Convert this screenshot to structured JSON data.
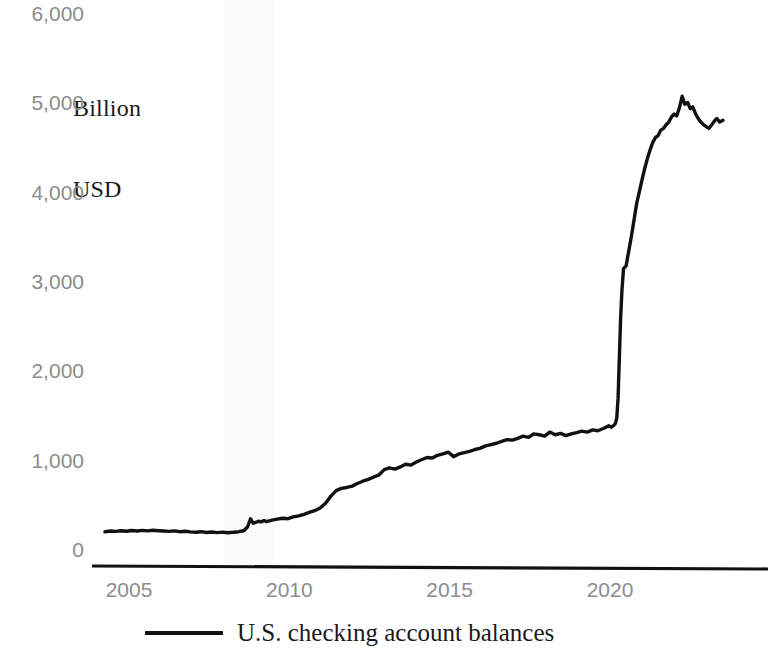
{
  "chart_data": {
    "type": "line",
    "title": "",
    "subtitle": "",
    "unit_label_line1": "Billion",
    "unit_label_line2": "USD",
    "xlabel": "",
    "ylabel": "Billion USD",
    "ylim": [
      0,
      6000
    ],
    "xlim": [
      2004.2,
      2023.6
    ],
    "grid": false,
    "legend_position": "bottom-center",
    "y_ticks": [
      {
        "value": 6000,
        "label": "6,000"
      },
      {
        "value": 5000,
        "label": "5,000"
      },
      {
        "value": 4000,
        "label": "4,000"
      },
      {
        "value": 3000,
        "label": "3,000"
      },
      {
        "value": 2000,
        "label": "2,000"
      },
      {
        "value": 1000,
        "label": "1,000"
      },
      {
        "value": 0,
        "label": "0"
      }
    ],
    "x_ticks": [
      {
        "value": 2005,
        "label": "2005"
      },
      {
        "value": 2010,
        "label": "2010"
      },
      {
        "value": 2015,
        "label": "2015"
      },
      {
        "value": 2020,
        "label": "2020"
      }
    ],
    "shaded_regions": [
      {
        "name": "recession-2007-2009",
        "x_start": 2007.95,
        "x_end": 2009.5,
        "color": "#fafafa"
      }
    ],
    "series": [
      {
        "name": "U.S. checking account balances",
        "color": "#111111",
        "line_width": 3.4,
        "x": [
          2004.25,
          2004.42,
          2004.58,
          2004.75,
          2004.92,
          2005.08,
          2005.25,
          2005.42,
          2005.58,
          2005.75,
          2005.92,
          2006.08,
          2006.25,
          2006.42,
          2006.58,
          2006.75,
          2006.92,
          2007.08,
          2007.25,
          2007.42,
          2007.58,
          2007.75,
          2007.92,
          2008.08,
          2008.25,
          2008.42,
          2008.58,
          2008.7,
          2008.79,
          2008.87,
          2008.95,
          2009.04,
          2009.12,
          2009.21,
          2009.29,
          2009.46,
          2009.62,
          2009.79,
          2009.96,
          2010.12,
          2010.29,
          2010.46,
          2010.62,
          2010.79,
          2010.96,
          2011.12,
          2011.29,
          2011.46,
          2011.62,
          2011.79,
          2011.96,
          2012.12,
          2012.29,
          2012.46,
          2012.62,
          2012.79,
          2012.96,
          2013.12,
          2013.29,
          2013.46,
          2013.62,
          2013.79,
          2013.96,
          2014.12,
          2014.29,
          2014.46,
          2014.62,
          2014.79,
          2014.96,
          2015.12,
          2015.29,
          2015.46,
          2015.62,
          2015.79,
          2015.96,
          2016.12,
          2016.29,
          2016.46,
          2016.62,
          2016.79,
          2016.96,
          2017.12,
          2017.29,
          2017.46,
          2017.62,
          2017.79,
          2017.96,
          2018.12,
          2018.29,
          2018.46,
          2018.62,
          2018.79,
          2018.96,
          2019.12,
          2019.29,
          2019.46,
          2019.62,
          2019.79,
          2019.96,
          2020.04,
          2020.12,
          2020.17,
          2020.21,
          2020.25,
          2020.29,
          2020.33,
          2020.37,
          2020.42,
          2020.5,
          2020.58,
          2020.67,
          2020.75,
          2020.83,
          2020.92,
          2021.0,
          2021.08,
          2021.17,
          2021.25,
          2021.33,
          2021.42,
          2021.5,
          2021.58,
          2021.67,
          2021.75,
          2021.83,
          2021.92,
          2022.0,
          2022.08,
          2022.17,
          2022.25,
          2022.33,
          2022.42,
          2022.5,
          2022.58,
          2022.67,
          2022.75,
          2022.83,
          2022.92,
          2023.0,
          2023.08,
          2023.17,
          2023.25,
          2023.33,
          2023.42,
          2023.52
        ],
        "y": [
          205,
          212,
          208,
          215,
          210,
          218,
          212,
          220,
          214,
          221,
          216,
          212,
          208,
          214,
          205,
          210,
          203,
          198,
          205,
          196,
          202,
          194,
          200,
          193,
          198,
          205,
          215,
          260,
          350,
          300,
          310,
          322,
          315,
          330,
          318,
          335,
          345,
          355,
          350,
          370,
          382,
          400,
          420,
          440,
          470,
          520,
          600,
          665,
          690,
          700,
          715,
          745,
          770,
          790,
          815,
          840,
          900,
          920,
          905,
          930,
          960,
          950,
          985,
          1010,
          1035,
          1030,
          1060,
          1075,
          1095,
          1045,
          1075,
          1090,
          1105,
          1125,
          1140,
          1165,
          1180,
          1195,
          1215,
          1235,
          1230,
          1250,
          1275,
          1260,
          1300,
          1290,
          1275,
          1320,
          1290,
          1305,
          1280,
          1300,
          1315,
          1330,
          1320,
          1345,
          1335,
          1360,
          1390,
          1375,
          1395,
          1420,
          1480,
          1700,
          2150,
          2600,
          2900,
          3150,
          3180,
          3340,
          3520,
          3700,
          3880,
          4020,
          4150,
          4270,
          4390,
          4480,
          4560,
          4620,
          4640,
          4700,
          4720,
          4760,
          4790,
          4850,
          4880,
          4860,
          4960,
          5080,
          4990,
          5010,
          4940,
          4960,
          4880,
          4830,
          4790,
          4760,
          4740,
          4720,
          4760,
          4800,
          4830,
          4790,
          4810
        ]
      }
    ]
  },
  "legend": {
    "label": "U.S. checking account balances"
  },
  "colors": {
    "line": "#111111",
    "tick_text": "#8c8c8c",
    "caption_text": "#1a1a1a",
    "axis": "#111111",
    "shading": "#fafafa",
    "background": "#ffffff"
  }
}
